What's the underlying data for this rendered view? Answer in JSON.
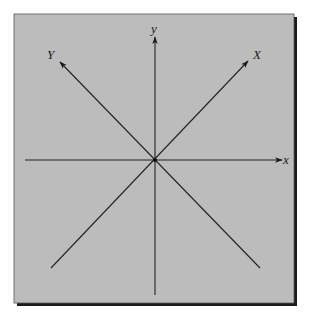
{
  "diagram": {
    "type": "coordinate-axes",
    "colors": {
      "panel_background": "#bcbcbc",
      "panel_border": "#1a1a1a",
      "panel_shadow": "#1a1a1a",
      "line": "#222222",
      "page_background": "#ffffff"
    },
    "origin": {
      "x": 155,
      "y": 160
    },
    "axes": [
      {
        "id": "x",
        "label": "x",
        "italic": true,
        "from": [
          25,
          160
        ],
        "to": [
          282,
          160
        ],
        "arrow": true,
        "label_pos": [
          285,
          164
        ]
      },
      {
        "id": "y",
        "label": "y",
        "italic": true,
        "from": [
          155,
          295
        ],
        "to": [
          155,
          37
        ],
        "arrow": true,
        "label_pos": [
          151,
          33
        ]
      },
      {
        "id": "X",
        "label": "X",
        "italic": true,
        "from": [
          51,
          268
        ],
        "to": [
          248,
          61
        ],
        "arrow": true,
        "label_pos": [
          254,
          58
        ]
      },
      {
        "id": "Y",
        "label": "Y",
        "italic": true,
        "from": [
          260,
          268
        ],
        "to": [
          60,
          62
        ],
        "arrow": true,
        "label_pos": [
          48,
          58
        ]
      }
    ]
  }
}
